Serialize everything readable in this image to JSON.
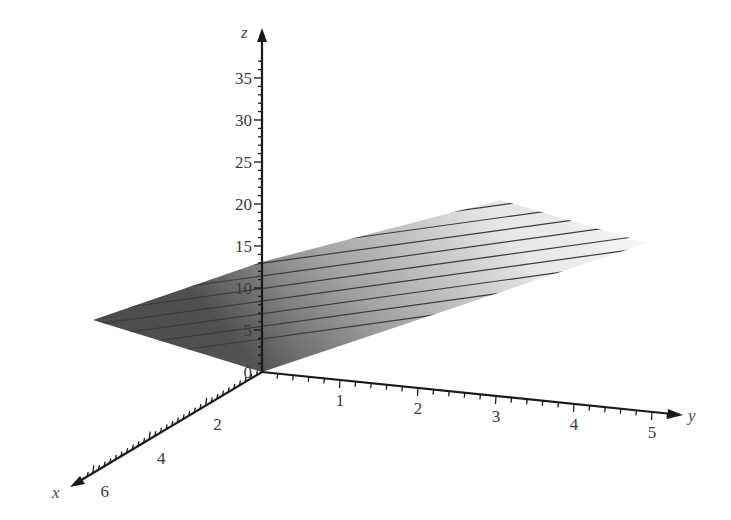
{
  "chart_data": {
    "type": "surface3d",
    "title": "",
    "axes": {
      "x": {
        "label": "x",
        "ticks": [
          2,
          4,
          6
        ],
        "range": [
          0,
          6.5
        ]
      },
      "y": {
        "label": "y",
        "ticks": [
          1,
          2,
          3,
          4,
          5
        ],
        "range": [
          0,
          5.3
        ]
      },
      "z": {
        "label": "z",
        "ticks": [
          0,
          5,
          10,
          15,
          20,
          25,
          30,
          35
        ],
        "range": [
          0,
          38
        ]
      }
    },
    "surface": {
      "description": "Planar surface shaded in grayscale with evenly spaced horizontal contour lines",
      "corners_approx": [
        {
          "x": 0,
          "y": 0,
          "z": 0
        },
        {
          "x": 0,
          "y": 5,
          "z": 17
        },
        {
          "x": 6,
          "y": 0,
          "z": 6
        },
        {
          "x": 6,
          "y": 5,
          "z": 23
        }
      ],
      "contour_count": 16,
      "shading": "grayscale gradient (darker near origin, lighter toward far edge)"
    },
    "grid": false,
    "legend": null
  },
  "labels": {
    "x_axis": "x",
    "y_axis": "y",
    "z_axis": "z",
    "z_ticks": [
      "0",
      "5",
      "10",
      "15",
      "20",
      "25",
      "30",
      "35"
    ],
    "x_ticks": [
      "2",
      "4",
      "6"
    ],
    "y_ticks": [
      "1",
      "2",
      "3",
      "4",
      "5"
    ]
  },
  "colors": {
    "axis": "#1a1a1a",
    "surface_dark": "#5e5e5e",
    "surface_light": "#f2f2f2",
    "contour": "#3c3c3c",
    "text": "#3a3a3a"
  }
}
